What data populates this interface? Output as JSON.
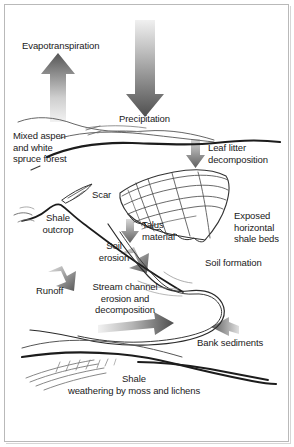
{
  "figure": {
    "background_color": "#ffffff",
    "border_color": "#b9b9b9",
    "ink_color": "#1a1a1a",
    "arrow_dark": "#5c5c5c",
    "arrow_light": "#e8e8e8",
    "width": 294,
    "height": 447
  },
  "labels": {
    "evapotranspiration": "Evapotranspiration",
    "precipitation": "Precipitation",
    "forest": "Mixed aspen\nand white\nspruce forest",
    "leaf_litter": "Leaf litter\ndecomposition",
    "scar": "Scar",
    "shale_outcrop": "Shale\noutcrop",
    "talus": "Talus\nmaterial",
    "exposed_beds": "Exposed\nhorizontal\nshale beds",
    "soil_erosion": "Soil\nerosion",
    "soil_formation": "Soil formation",
    "runoff": "Runoff",
    "stream_channel": "Stream channel\nerosion and\ndecomposition",
    "bank_sediments": "Bank sediments",
    "shale_weathering_line1": "Shale",
    "shale_weathering_line2": "weathering by moss and lichens"
  },
  "arrows": [
    {
      "name": "evapotranspiration-arrow",
      "direction": "up",
      "label_key": "evapotranspiration"
    },
    {
      "name": "precipitation-arrow",
      "direction": "down",
      "label_key": "precipitation"
    },
    {
      "name": "leaf-litter-arrow",
      "direction": "down",
      "label_key": "leaf_litter"
    },
    {
      "name": "talus-arrow",
      "direction": "down",
      "label_key": "talus"
    },
    {
      "name": "soil-erosion-arrow",
      "direction": "down-right",
      "label_key": "soil_erosion"
    },
    {
      "name": "runoff-arrow",
      "direction": "down-right",
      "label_key": "runoff"
    },
    {
      "name": "stream-flow-arrow",
      "direction": "right",
      "label_key": "stream_channel"
    },
    {
      "name": "bank-sediments-arrow",
      "direction": "left",
      "label_key": "bank_sediments"
    }
  ]
}
